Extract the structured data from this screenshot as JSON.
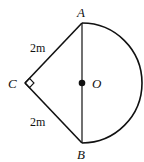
{
  "diagram": {
    "points": {
      "A": {
        "label": "A",
        "x": 82,
        "y": 23
      },
      "B": {
        "label": "B",
        "x": 82,
        "y": 143
      },
      "C": {
        "label": "C",
        "x": 25,
        "y": 83
      },
      "O": {
        "label": "O",
        "x": 82,
        "y": 83
      }
    },
    "segments": [
      {
        "from": "C",
        "to": "A",
        "label": "2m"
      },
      {
        "from": "C",
        "to": "B",
        "label": "2m"
      },
      {
        "from": "A",
        "to": "B",
        "label": ""
      }
    ],
    "arc": {
      "center": "O",
      "from": "A",
      "to": "B",
      "type": "semicircle",
      "side": "right"
    },
    "right_angle_at": "C",
    "labels": {
      "A": "A",
      "B": "B",
      "C": "C",
      "O": "O",
      "CA": "2m",
      "CB": "2m"
    },
    "colors": {
      "stroke": "#111111",
      "background": "#ffffff"
    }
  }
}
